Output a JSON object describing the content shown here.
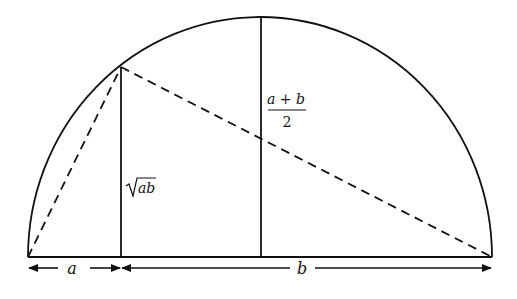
{
  "diagram": {
    "labels": {
      "segment_a": "a",
      "segment_b": "b",
      "geometric_mean_radicand": "ab",
      "arithmetic_mean_numerator": "a + b",
      "arithmetic_mean_denominator": "2"
    },
    "colors": {
      "stroke": "#111111",
      "background": "#ffffff"
    }
  }
}
